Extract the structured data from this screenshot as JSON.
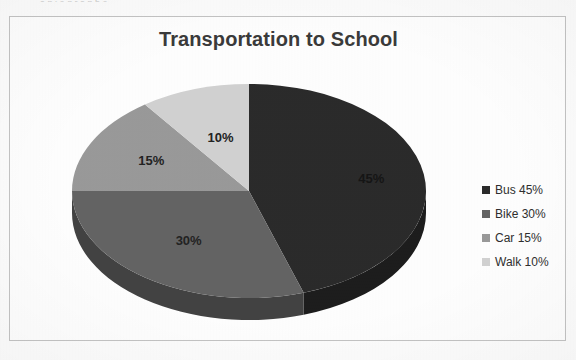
{
  "document": {
    "cutoff_text_fragment": "a   p     i   e    g  r  a  p  h          e",
    "background_color": "#fdfdfd"
  },
  "chart_frame": {
    "border_color": "#c4c4c4",
    "background_color": "#ffffff"
  },
  "chart_data": {
    "type": "pie",
    "title": "Transportation to School",
    "xlabel": "",
    "ylabel": "",
    "categories": [
      "Bus",
      "Bike",
      "Car",
      "Walk"
    ],
    "values": [
      45,
      30,
      15,
      10
    ],
    "value_unit": "%",
    "data_labels": [
      "45%",
      "30%",
      "15%",
      "10%"
    ],
    "colors": [
      "#2b2b2b",
      "#646464",
      "#9a9a9a",
      "#d2d2d2"
    ],
    "side_colors": [
      "#1d1d1d",
      "#434343",
      "#6b6b6b",
      "#9d9d9d"
    ],
    "three_d": true,
    "start_angle_deg": 0,
    "direction": "clockwise",
    "legend": {
      "position": "right",
      "entries": [
        {
          "label": "Bus 45%",
          "color": "#2b2b2b"
        },
        {
          "label": "Bike 30%",
          "color": "#646464"
        },
        {
          "label": "Car 15%",
          "color": "#9a9a9a"
        },
        {
          "label": "Walk 10%",
          "color": "#d2d2d2"
        }
      ]
    },
    "geometry": {
      "center_x": 248,
      "center_y": 190,
      "radius_x": 177,
      "radius_y": 107,
      "depth": 22
    }
  }
}
